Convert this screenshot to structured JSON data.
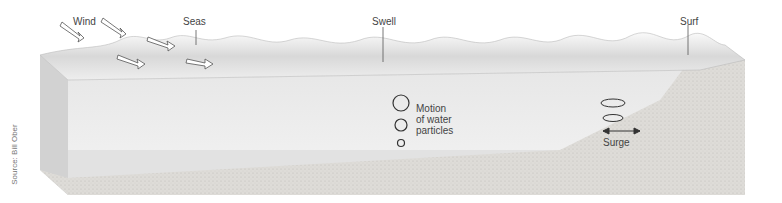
{
  "labels": {
    "wind": "Wind",
    "seas": "Seas",
    "swell": "Swell",
    "surf": "Surf",
    "motion": [
      "Motion",
      "of water",
      "particles"
    ],
    "surge": "Surge"
  },
  "source": "Source: Bill Ober",
  "colors": {
    "water_light": "#f2f2f2",
    "water_mid": "#dcdcdc",
    "sand": "#d8d6d2",
    "text": "#444444"
  }
}
